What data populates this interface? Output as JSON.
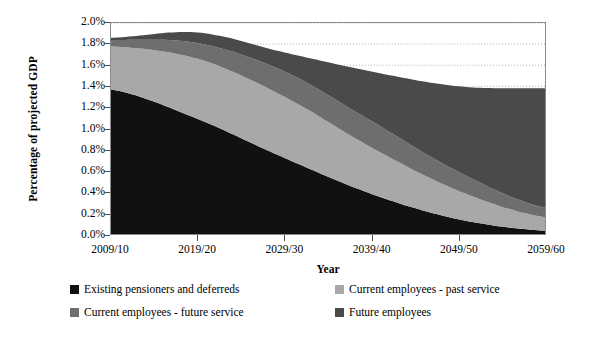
{
  "chart_data": {
    "type": "area",
    "stacked": true,
    "title": "",
    "xlabel": "Year",
    "ylabel": "Percentage of projected GDP",
    "x": [
      "2009/10",
      "2019/20",
      "2029/30",
      "2039/40",
      "2049/50",
      "2059/60"
    ],
    "x_tick_labels": [
      "2009/10",
      "2019/20",
      "2029/30",
      "2039/40",
      "2049/50",
      "2059/60"
    ],
    "y_tick_labels": [
      "0.0%",
      "0.2%",
      "0.4%",
      "0.6%",
      "0.8%",
      "1.0%",
      "1.2%",
      "1.4%",
      "1.6%",
      "1.8%",
      "2.0%"
    ],
    "ylim": [
      0.0,
      2.0
    ],
    "y_tick_step": 0.2,
    "grid": "horizontal-dotted",
    "legend_position": "bottom",
    "units": "percent of GDP",
    "series": [
      {
        "name": "Existing pensioners and deferreds",
        "color": "#111111",
        "values": [
          1.37,
          1.09,
          0.72,
          0.38,
          0.14,
          0.03
        ]
      },
      {
        "name": "Current employees - past service",
        "color": "#a8a8a8",
        "values": [
          0.41,
          0.57,
          0.58,
          0.44,
          0.27,
          0.13
        ]
      },
      {
        "name": "Current employees - future service",
        "color": "#6e6e6e",
        "values": [
          0.06,
          0.15,
          0.24,
          0.25,
          0.18,
          0.09
        ]
      },
      {
        "name": "Future employees",
        "color": "#4a4a4a",
        "values": [
          0.02,
          0.1,
          0.18,
          0.47,
          0.81,
          1.13
        ]
      }
    ],
    "totals": [
      1.86,
      1.91,
      1.72,
      1.54,
      1.4,
      1.38
    ],
    "annotations": []
  },
  "axes": {
    "y_title": "Percentage of projected GDP",
    "x_title": "Year"
  },
  "legend": {
    "items": [
      {
        "label": "Existing pensioners and deferreds",
        "color": "#111111"
      },
      {
        "label": "Current employees - past service",
        "color": "#a8a8a8"
      },
      {
        "label": "Current employees - future service",
        "color": "#6e6e6e"
      },
      {
        "label": "Future employees",
        "color": "#4a4a4a"
      }
    ]
  }
}
